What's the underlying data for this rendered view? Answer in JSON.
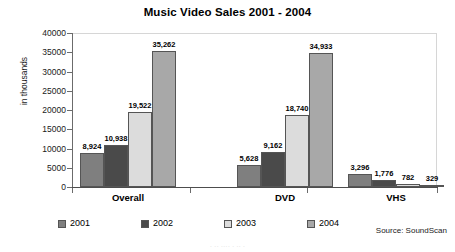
{
  "chart_data": {
    "type": "bar",
    "title": "Music Video Sales 2001 - 2004",
    "xlabel": "",
    "ylabel": "in thousands",
    "ylim": [
      0,
      40000
    ],
    "ytick_step": 5000,
    "yticks": [
      "40000",
      "35000",
      "30000",
      "25000",
      "20000",
      "15000",
      "10000",
      "5000",
      "0"
    ],
    "categories": [
      "Overall",
      "DVD",
      "VHS"
    ],
    "grid": false,
    "legend_position": "bottom",
    "series": [
      {
        "name": "2001",
        "color": "#7f7f7f",
        "values": [
          8924,
          9162,
          3296
        ],
        "labels": [
          "8,924",
          "5,628",
          "3,296"
        ]
      },
      {
        "name": "2002",
        "color": "#4a4a4a",
        "values": [
          10938,
          9162,
          1776
        ],
        "labels": [
          "10,938",
          "9,162",
          "1,776"
        ]
      },
      {
        "name": "2003",
        "color": "#dcdcdc",
        "values": [
          19522,
          18740,
          782
        ],
        "labels": [
          "19,522",
          "18,740",
          "782"
        ]
      },
      {
        "name": "2004",
        "color": "#a8a8a8",
        "values": [
          35262,
          34933,
          329
        ],
        "labels": [
          "35,262",
          "34,933",
          "329"
        ]
      }
    ],
    "data_by_category": {
      "Overall": {
        "2001": 8924,
        "2002": 10938,
        "2003": 19522,
        "2004": 35262
      },
      "DVD": {
        "2001": 5628,
        "2002": 9162,
        "2003": 18740,
        "2004": 34933
      },
      "VHS": {
        "2001": 3296,
        "2002": 1776,
        "2003": 782,
        "2004": 329
      }
    },
    "annotations": {
      "source": "Source: SoundScan"
    }
  },
  "footer": {
    "ghost_text": "· ·· ···· · ·· ·"
  }
}
